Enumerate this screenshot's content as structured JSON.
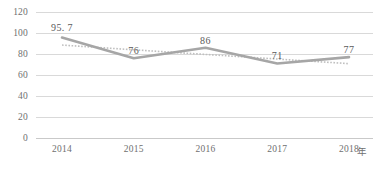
{
  "chart_data": {
    "type": "line",
    "title": "",
    "subtitle": "",
    "xlabel": "年",
    "ylabel": "",
    "categories": [
      "2014",
      "2015",
      "2016",
      "2017",
      "2018"
    ],
    "series": [
      {
        "name": "数值",
        "style": "solid",
        "color": "#a6a6a6",
        "values": [
          95.7,
          76,
          86,
          71,
          77
        ],
        "labels": [
          "95. 7",
          "76",
          "86",
          "71",
          "77"
        ]
      },
      {
        "name": "趋势线",
        "style": "dotted",
        "color": "#bfbfbf",
        "values": [
          88.5,
          84.0,
          79.6,
          75.2,
          70.8
        ]
      }
    ],
    "ylim": [
      0,
      120
    ],
    "yticks": [
      0,
      20,
      40,
      60,
      80,
      100,
      120
    ],
    "ytick_labels": [
      "0",
      "20",
      "40",
      "60",
      "80",
      "100",
      "120"
    ],
    "grid": true,
    "grid_color": "#d9d9d9",
    "legend": "none",
    "axis_color": "#c9c9c9",
    "background": "#ffffff",
    "label_color": "#6f6f6f",
    "data_label_color": "#595959"
  }
}
